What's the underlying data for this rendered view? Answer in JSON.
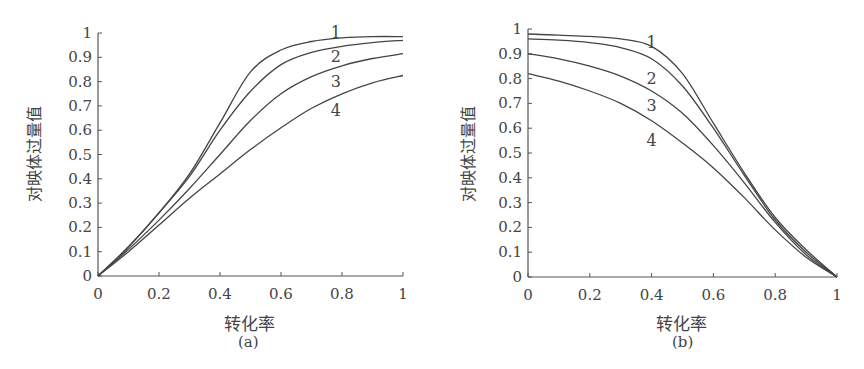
{
  "chart_data": [
    {
      "type": "line",
      "panel_label": "(a)",
      "title": "",
      "xlabel": "转化率",
      "ylabel": "对映体过量值",
      "xlim": [
        0,
        1
      ],
      "ylim": [
        0,
        1
      ],
      "xticks": [
        "0",
        "0.2",
        "0.4",
        "0.6",
        "0.8",
        "1"
      ],
      "yticks": [
        "0",
        "0.1",
        "0.2",
        "0.3",
        "0.4",
        "0.5",
        "0.6",
        "0.7",
        "0.8",
        "0.9",
        "1"
      ],
      "grid": false,
      "legend": "inline numeric labels 1-4 near curve ends",
      "x": [
        0,
        0.1,
        0.2,
        0.3,
        0.4,
        0.5,
        0.6,
        0.7,
        0.8,
        0.9,
        1.0
      ],
      "series": [
        {
          "name": "1",
          "values": [
            0,
            0.12,
            0.26,
            0.42,
            0.63,
            0.84,
            0.93,
            0.965,
            0.98,
            0.985,
            0.985
          ]
        },
        {
          "name": "2",
          "values": [
            0,
            0.12,
            0.26,
            0.41,
            0.6,
            0.76,
            0.87,
            0.92,
            0.945,
            0.96,
            0.97
          ]
        },
        {
          "name": "3",
          "values": [
            0,
            0.11,
            0.23,
            0.36,
            0.5,
            0.64,
            0.75,
            0.82,
            0.865,
            0.895,
            0.915
          ]
        },
        {
          "name": "4",
          "values": [
            0,
            0.1,
            0.21,
            0.32,
            0.42,
            0.52,
            0.61,
            0.69,
            0.75,
            0.795,
            0.825
          ]
        }
      ],
      "label_positions": [
        {
          "name": "1",
          "x": 0.78,
          "y": 1.0
        },
        {
          "name": "2",
          "x": 0.78,
          "y": 0.9
        },
        {
          "name": "3",
          "x": 0.78,
          "y": 0.8
        },
        {
          "name": "4",
          "x": 0.78,
          "y": 0.68
        }
      ]
    },
    {
      "type": "line",
      "panel_label": "(b)",
      "title": "",
      "xlabel": "转化率",
      "ylabel": "对映体过量值",
      "xlim": [
        0,
        1
      ],
      "ylim": [
        0,
        1
      ],
      "xticks": [
        "0",
        "0.2",
        "0.4",
        "0.6",
        "0.8",
        "1"
      ],
      "yticks": [
        "0",
        "0.1",
        "0.2",
        "0.3",
        "0.4",
        "0.5",
        "0.6",
        "0.7",
        "0.8",
        "0.9",
        "1"
      ],
      "grid": false,
      "legend": "inline numeric labels 1-4 near curves",
      "x": [
        0,
        0.1,
        0.2,
        0.3,
        0.4,
        0.5,
        0.6,
        0.7,
        0.8,
        0.9,
        1.0
      ],
      "series": [
        {
          "name": "1",
          "values": [
            0.98,
            0.975,
            0.97,
            0.96,
            0.93,
            0.82,
            0.62,
            0.42,
            0.24,
            0.11,
            0.0
          ]
        },
        {
          "name": "2",
          "values": [
            0.96,
            0.955,
            0.945,
            0.925,
            0.88,
            0.77,
            0.6,
            0.41,
            0.23,
            0.1,
            0.0
          ]
        },
        {
          "name": "3",
          "values": [
            0.9,
            0.88,
            0.85,
            0.81,
            0.75,
            0.66,
            0.53,
            0.38,
            0.22,
            0.09,
            0.0
          ]
        },
        {
          "name": "4",
          "values": [
            0.82,
            0.79,
            0.75,
            0.7,
            0.63,
            0.54,
            0.44,
            0.32,
            0.19,
            0.08,
            0.0
          ]
        }
      ],
      "label_positions": [
        {
          "name": "1",
          "x": 0.4,
          "y": 0.945
        },
        {
          "name": "2",
          "x": 0.4,
          "y": 0.8
        },
        {
          "name": "3",
          "x": 0.4,
          "y": 0.69
        },
        {
          "name": "4",
          "x": 0.4,
          "y": 0.55
        }
      ]
    }
  ],
  "panels": [
    {
      "xlabel": "转化率",
      "ylabel": "对映体过量值",
      "sublabel": "(a)"
    },
    {
      "xlabel": "转化率",
      "ylabel": "对映体过量值",
      "sublabel": "(b)"
    }
  ],
  "colors": {
    "axis": "#555555",
    "line": "#444444",
    "text": "#444444"
  }
}
